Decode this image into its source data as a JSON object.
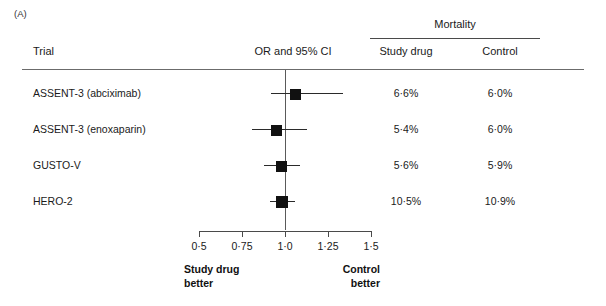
{
  "panel": {
    "label": "(A)"
  },
  "header": {
    "group_title": "Mortality",
    "trial_col": "Trial",
    "or_col": "OR and 95% CI",
    "study_drug_col": "Study drug",
    "control_col": "Control"
  },
  "footer": {
    "left_line1": "Study drug",
    "left_line2": "better",
    "right_line1": "Control",
    "right_line2": "better"
  },
  "chart_data": {
    "type": "forest",
    "title": "Mortality",
    "xlabel": "OR and 95% CI",
    "ylabel": "Trial",
    "xlim": [
      0.5,
      1.5
    ],
    "xscale": "linear",
    "null_value": 1.0,
    "grid": false,
    "legend": null,
    "tick_labels": [
      "0·5",
      "0·75",
      "1·0",
      "1·25",
      "1·5"
    ],
    "ticks": [
      0.5,
      0.75,
      1.0,
      1.25,
      1.5
    ],
    "categories": [
      "ASSENT-3 (abciximab)",
      "ASSENT-3 (enoxaparin)",
      "GUSTO-V",
      "HERO-2"
    ],
    "or": [
      1.06,
      0.95,
      0.98,
      0.98
    ],
    "ci_low": [
      0.92,
      0.81,
      0.88,
      0.91
    ],
    "ci_high": [
      1.34,
      1.13,
      1.09,
      1.06
    ],
    "marker_size": [
      11,
      11,
      11,
      12
    ],
    "series": [
      {
        "name": "Study drug",
        "values": [
          "6·6%",
          "5·4%",
          "5·6%",
          "10·5%"
        ]
      },
      {
        "name": "Control",
        "values": [
          "6·0%",
          "6·0%",
          "5·9%",
          "10·9%"
        ]
      }
    ],
    "annotations": {
      "left_direction": "Study drug better",
      "right_direction": "Control better"
    },
    "colors": {
      "marker": "#111111",
      "line": "#2a2a2a",
      "axis": "#4a4a4a",
      "rule": "#6b6b6b",
      "text": "#1a1a1a"
    }
  }
}
